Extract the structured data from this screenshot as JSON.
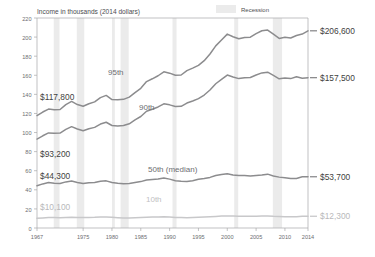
{
  "chart_data": {
    "type": "line",
    "title": "Income in thousands (2014 dollars)",
    "xlabel": "",
    "ylabel": "Income in thousands (2014 dollars)",
    "xlim": [
      1967,
      2014
    ],
    "ylim": [
      0,
      220
    ],
    "yticks": [
      0,
      20,
      40,
      60,
      80,
      100,
      120,
      140,
      160,
      180,
      200,
      220
    ],
    "xticks": [
      1967,
      1975,
      1980,
      1985,
      1990,
      1995,
      2000,
      2005,
      2010,
      2014
    ],
    "grid": false,
    "legend": {
      "position": "top-right",
      "entries": [
        {
          "label": "Recession",
          "color": "#e8e8e8",
          "type": "band"
        }
      ]
    },
    "x": [
      1967,
      1968,
      1969,
      1970,
      1971,
      1972,
      1973,
      1974,
      1975,
      1976,
      1977,
      1978,
      1979,
      1980,
      1981,
      1982,
      1983,
      1984,
      1985,
      1986,
      1987,
      1988,
      1989,
      1990,
      1991,
      1992,
      1993,
      1994,
      1995,
      1996,
      1997,
      1998,
      1999,
      2000,
      2001,
      2002,
      2003,
      2004,
      2005,
      2006,
      2007,
      2008,
      2009,
      2010,
      2011,
      2012,
      2013,
      2014
    ],
    "series": [
      {
        "name": "95th",
        "label": "95th",
        "color": "#8c8c8e",
        "start_label": "$117,800",
        "end_label": "$206,600",
        "start_value": 117.8,
        "end_value": 206.6,
        "values": [
          117.8,
          121.5,
          124.6,
          124.0,
          124.2,
          129.3,
          132.6,
          129.3,
          127.5,
          130.2,
          132.1,
          136.6,
          138.9,
          134.5,
          134.3,
          134.8,
          137.1,
          141.9,
          146.3,
          153.4,
          156.3,
          159.5,
          163.6,
          162.2,
          160.0,
          160.3,
          164.9,
          167.5,
          170.4,
          175.3,
          182.3,
          190.8,
          196.9,
          203.1,
          200.4,
          198.2,
          199.6,
          199.9,
          203.7,
          206.6,
          207.4,
          203.0,
          198.6,
          199.8,
          199.0,
          201.6,
          203.2,
          206.6
        ]
      },
      {
        "name": "90th",
        "label": "90th",
        "color": "#8c8c8e",
        "start_label": "$93,200",
        "end_label": "$157,500",
        "start_value": 93.2,
        "end_value": 157.5,
        "values": [
          93.2,
          96.6,
          99.6,
          99.2,
          99.4,
          103.3,
          106.2,
          103.7,
          101.9,
          104.0,
          105.4,
          108.9,
          110.8,
          107.4,
          106.9,
          107.3,
          109.2,
          113.3,
          116.8,
          122.3,
          124.4,
          126.8,
          130.1,
          129.0,
          127.3,
          127.5,
          130.9,
          133.0,
          135.5,
          139.3,
          144.6,
          151.1,
          155.6,
          160.2,
          158.2,
          156.5,
          157.5,
          157.7,
          160.3,
          162.5,
          163.2,
          159.8,
          156.3,
          157.2,
          156.5,
          158.4,
          156.8,
          157.5
        ]
      },
      {
        "name": "50th (median)",
        "label": "50th (median)",
        "color": "#8c8c8e",
        "start_label": "$44,300",
        "end_label": "$53,700",
        "start_value": 44.3,
        "end_value": 53.7,
        "values": [
          44.3,
          46.2,
          47.6,
          46.9,
          46.6,
          48.3,
          49.2,
          47.7,
          46.5,
          47.3,
          47.6,
          49.0,
          49.4,
          47.6,
          46.8,
          46.3,
          46.5,
          47.6,
          48.6,
          50.2,
          50.9,
          51.3,
          52.4,
          51.2,
          49.6,
          49.1,
          48.8,
          49.5,
          51.0,
          51.8,
          53.0,
          55.0,
          56.1,
          56.8,
          55.6,
          54.9,
          54.9,
          54.6,
          55.1,
          55.6,
          56.4,
          54.4,
          53.3,
          52.6,
          51.8,
          51.8,
          53.6,
          53.7
        ]
      },
      {
        "name": "10th",
        "label": "10th",
        "color": "#c8c8ca",
        "start_label": "$10,100",
        "end_label": "$12,300",
        "start_value": 10.1,
        "end_value": 12.3,
        "values": [
          10.1,
          10.6,
          11.0,
          10.9,
          10.8,
          11.1,
          11.3,
          11.1,
          10.9,
          11.1,
          11.2,
          11.5,
          11.5,
          11.2,
          10.8,
          10.5,
          10.5,
          10.7,
          10.9,
          11.2,
          11.4,
          11.5,
          11.7,
          11.5,
          11.1,
          10.9,
          10.7,
          10.9,
          11.2,
          11.4,
          11.7,
          12.1,
          12.5,
          12.7,
          12.6,
          12.4,
          12.4,
          12.3,
          12.4,
          12.5,
          12.6,
          12.2,
          12.0,
          11.9,
          11.7,
          11.7,
          12.2,
          12.3
        ]
      }
    ],
    "recessions": [
      {
        "start": 1969.9,
        "end": 1970.9
      },
      {
        "start": 1973.9,
        "end": 1975.2
      },
      {
        "start": 1980.0,
        "end": 1980.5
      },
      {
        "start": 1981.5,
        "end": 1982.9
      },
      {
        "start": 1990.5,
        "end": 1991.2
      },
      {
        "start": 2001.2,
        "end": 2001.9
      },
      {
        "start": 2007.9,
        "end": 2009.5
      }
    ],
    "colors": {
      "line_dark": "#8c8c8e",
      "line_light": "#c8c8ca",
      "recession_band": "#ebebeb",
      "axis": "#a7a7a9",
      "text": "#58595b"
    }
  }
}
